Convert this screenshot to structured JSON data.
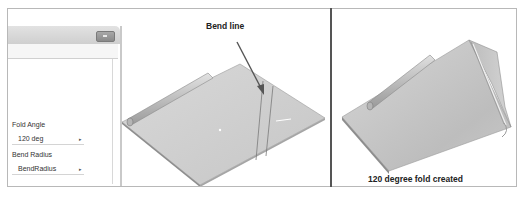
{
  "left_panel": {
    "callout_label": "Bend line",
    "dialog": {
      "fields": [
        {
          "label": "Fold Angle",
          "value": "120 deg"
        },
        {
          "label": "Bend Radius",
          "value": "BendRadius"
        }
      ],
      "dropdown_arrow": "▸"
    }
  },
  "right_panel": {
    "caption": "120 degree fold created"
  },
  "colors": {
    "sheet_fill": "#cfcfcf",
    "sheet_edge": "#8c8c8c",
    "arrow": "#555555",
    "divider": "#555555",
    "frame_border": "#b8b8b8"
  }
}
